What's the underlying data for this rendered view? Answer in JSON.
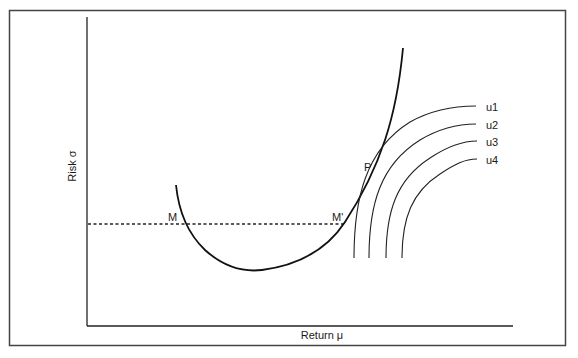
{
  "diagram": {
    "y_axis_label": "Risk σ",
    "x_axis_label": "Return μ",
    "points": {
      "m": "M",
      "m_prime": "M'",
      "p": "P"
    },
    "indifference_curves": [
      {
        "label": "u1"
      },
      {
        "label": "u2"
      },
      {
        "label": "u3"
      },
      {
        "label": "u4"
      }
    ],
    "colors": {
      "ink": "#1a1a1a",
      "frame": "#444444"
    }
  }
}
